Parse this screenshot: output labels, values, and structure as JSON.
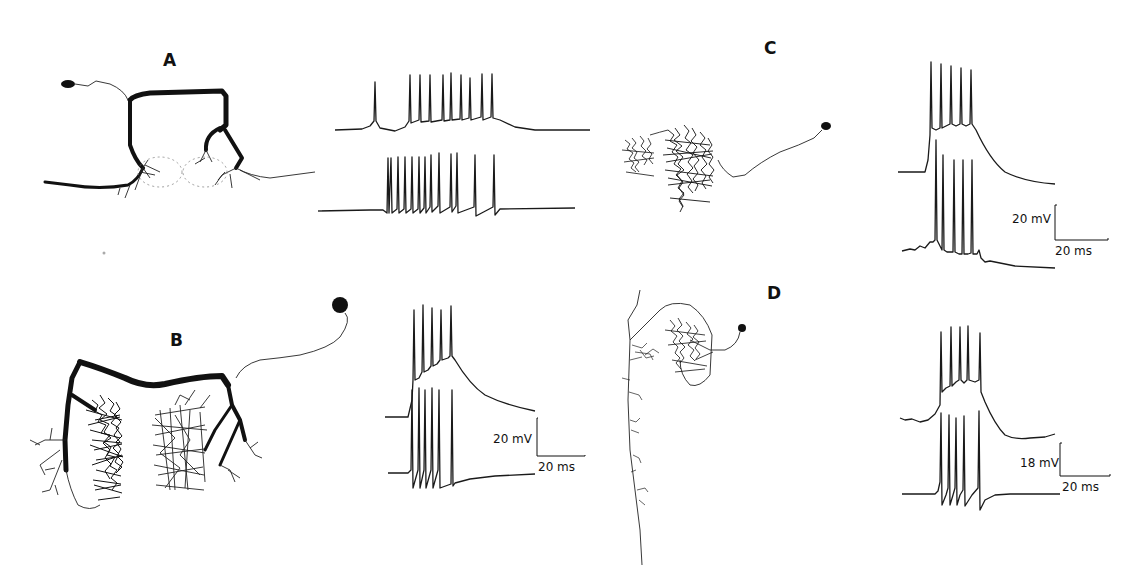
{
  "figure": {
    "panels": [
      {
        "label": "A",
        "traces": 2,
        "scale_bar": null
      },
      {
        "label": "B",
        "traces": 2,
        "scale_bar": {
          "voltage": "20 mV",
          "time": "20 ms"
        }
      },
      {
        "label": "C",
        "traces": 2,
        "scale_bar": {
          "voltage": "20 mV",
          "time": "20 ms"
        }
      },
      {
        "label": "D",
        "traces": 2,
        "scale_bar": {
          "voltage": "18 mV",
          "time": "20 ms"
        }
      }
    ]
  },
  "labels": {
    "A": "A",
    "B": "B",
    "C": "C",
    "D": "D"
  },
  "scale": {
    "B_v": "20 mV",
    "B_t": "20 ms",
    "C_v": "20 mV",
    "C_t": "20 ms",
    "D_v": "18 mV",
    "D_t": "20 ms"
  },
  "colors": {
    "ink": "#111111",
    "background": "#ffffff"
  }
}
